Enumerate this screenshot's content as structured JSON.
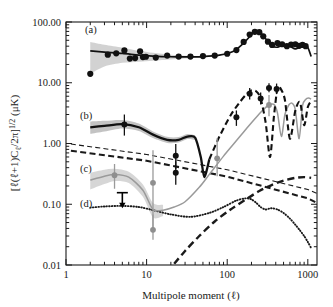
{
  "figure": {
    "name": "cmb-angular-power-spectra",
    "xlabel": "Multipole moment (ℓ)",
    "ylabel_main": "[ℓ(ℓ+1)C",
    "ylabel_sub": "ℓ",
    "ylabel_mid": "/2π]",
    "ylabel_sup": "1/2",
    "ylabel_units": "(μK)",
    "panel_labels": {
      "a": "(a)",
      "b": "(b)",
      "c": "(c)",
      "d": "(d)"
    },
    "x_ticks": [
      "1",
      "10",
      "100",
      "1000"
    ],
    "y_ticks": [
      "100.00",
      "10.00",
      "1.00",
      "0.10",
      "0.01"
    ]
  },
  "chart_data": {
    "type": "line",
    "title": "",
    "xlabel": "Multipole moment (ℓ)",
    "ylabel": "[ℓ(ℓ+1)Cℓ/2π]^1/2 (μK)",
    "xscale": "log",
    "yscale": "log",
    "xlim": [
      1,
      1300
    ],
    "ylim": [
      0.01,
      100.0
    ],
    "grid": false,
    "legend": "none",
    "panels": [
      {
        "key": "a",
        "label": "(a)",
        "description": "Temperature (TT) angular power spectrum",
        "style": "solid black curve with gray 1-sigma band at low multipoles, filled black circles"
      },
      {
        "key": "b",
        "label": "(b)",
        "description": "Temperature-polarization cross spectrum (TE), thick black solid and dashed curve with gray band",
        "style": "thick black solid / dashed"
      },
      {
        "key": "c",
        "label": "(c)",
        "description": "E-mode polarization (EE) spectrum, gray solid curve with gray points",
        "style": "gray solid"
      },
      {
        "key": "d",
        "label": "(d)",
        "description": "B-mode polarization from lensing (dotted) and gravitational waves (thick dashed rising)",
        "style": "dotted black / thick dashed"
      }
    ],
    "series": [
      {
        "name": "TT model curve",
        "panel": "a",
        "style": "solid-black",
        "x": [
          2,
          3,
          5,
          8,
          12,
          20,
          30,
          50,
          80,
          120,
          160,
          200,
          220,
          260,
          300,
          350,
          420,
          500,
          600,
          700,
          800,
          900,
          1000,
          1100
        ],
        "y": [
          33.5,
          32.0,
          30.5,
          28.5,
          27.5,
          26.8,
          26.6,
          27.0,
          28.5,
          33.0,
          45.0,
          62.0,
          70.0,
          66.0,
          53.0,
          41.0,
          38.5,
          43.0,
          40.0,
          36.0,
          39.0,
          40.5,
          38.0,
          27.0
        ]
      },
      {
        "name": "TT data points",
        "panel": "a",
        "style": "black-filled-circles",
        "x": [
          2,
          3.3,
          4.2,
          5.3,
          6.2,
          7.2,
          8.3,
          9.0,
          9.8,
          13,
          18,
          25,
          35,
          50,
          70,
          100,
          130,
          160,
          190,
          220,
          250,
          280,
          320,
          360,
          420,
          480,
          550,
          620,
          700,
          780,
          860,
          940
        ],
        "y": [
          14.0,
          29.0,
          30.5,
          34.0,
          25.0,
          25.5,
          33.0,
          26.5,
          26.8,
          26.0,
          28.0,
          27.0,
          27.0,
          27.5,
          28.0,
          30.0,
          34.5,
          47.0,
          62.0,
          69.0,
          68.0,
          58.0,
          47.5,
          42.0,
          45.0,
          43.0,
          40.0,
          42.5,
          43.0,
          40.5,
          42.0,
          40.0
        ]
      },
      {
        "name": "TE model curve",
        "panel": "b",
        "style": "thick-black-solid-then-dashed",
        "x": [
          2,
          3,
          5,
          8,
          12,
          18,
          25,
          32,
          40,
          47,
          52,
          60,
          80,
          110,
          140,
          170,
          200,
          230,
          260,
          300,
          340,
          380,
          420,
          460,
          520,
          600,
          700,
          800,
          900,
          1000,
          1100
        ],
        "y": [
          1.85,
          1.95,
          2.08,
          1.85,
          1.4,
          1.15,
          1.15,
          1.3,
          1.25,
          0.6,
          0.28,
          0.55,
          1.3,
          2.9,
          4.6,
          6.3,
          7.5,
          7.2,
          5.5,
          2.2,
          0.6,
          2.8,
          8.2,
          8.0,
          5.2,
          1.2,
          3.5,
          4.8,
          2.0,
          4.0,
          5.0
        ]
      },
      {
        "name": "TE data points",
        "panel": "b",
        "style": "black-filled-circles-with-errorbars",
        "x": [
          5.3,
          23,
          23,
          130,
          190,
          260,
          330,
          410
        ],
        "y": [
          2.05,
          0.63,
          0.33,
          2.7,
          6.6,
          5.5,
          8.2,
          7.9
        ],
        "yerr_lo": [
          0.7,
          0.25,
          0.12,
          0.75,
          1.3,
          1.1,
          1.2,
          1.4
        ],
        "yerr_hi": [
          0.95,
          0.35,
          0.18,
          0.8,
          1.6,
          1.4,
          1.6,
          1.8
        ]
      },
      {
        "name": "EE model curve",
        "panel": "c",
        "style": "gray-solid",
        "x": [
          2,
          3,
          4,
          6,
          9,
          12,
          16,
          22,
          30,
          45,
          60,
          90,
          120,
          160,
          200,
          240,
          280,
          330,
          380,
          420,
          470,
          520,
          580,
          640,
          700,
          780,
          860,
          940,
          1020,
          1100
        ],
        "y": [
          0.25,
          0.29,
          0.31,
          0.28,
          0.17,
          0.082,
          0.08,
          0.09,
          0.11,
          0.19,
          0.31,
          0.62,
          0.98,
          1.55,
          2.2,
          2.9,
          3.6,
          4.3,
          4.4,
          3.2,
          1.3,
          3.0,
          4.3,
          4.6,
          3.6,
          1.2,
          4.2,
          5.3,
          5.6,
          5.4
        ]
      },
      {
        "name": "EE data points",
        "panel": "c",
        "style": "gray-filled-circles-with-errorbars",
        "x": [
          4.0,
          12,
          12,
          75,
          330
        ],
        "y": [
          0.3,
          0.225,
          0.038,
          0.57,
          4.3
        ],
        "yerr_lo": [
          0.12,
          0.19,
          0.012,
          0.28,
          1.5
        ],
        "yerr_hi": [
          0.16,
          0.55,
          0.03,
          0.65,
          2.0
        ]
      },
      {
        "name": "BB lensing",
        "panel": "d",
        "style": "black-dotted",
        "x": [
          2,
          3,
          5,
          8,
          12,
          20,
          35,
          60,
          90,
          130,
          170,
          200,
          230,
          260,
          300,
          350,
          420,
          500,
          600,
          700,
          800,
          900,
          1000,
          1100
        ],
        "y": [
          0.088,
          0.092,
          0.094,
          0.09,
          0.08,
          0.068,
          0.062,
          0.072,
          0.09,
          0.115,
          0.125,
          0.12,
          0.105,
          0.09,
          0.082,
          0.086,
          0.082,
          0.072,
          0.058,
          0.046,
          0.037,
          0.03,
          0.024,
          0.019
        ]
      },
      {
        "name": "BB gravitational waves",
        "panel": "d",
        "style": "thick-black-dashed-rising",
        "x": [
          22,
          30,
          45,
          70,
          110,
          170,
          250,
          350,
          500,
          700,
          900,
          1100
        ],
        "y": [
          0.0105,
          0.017,
          0.03,
          0.052,
          0.082,
          0.12,
          0.165,
          0.205,
          0.245,
          0.272,
          0.28,
          0.272
        ]
      },
      {
        "name": "Foreground upper bound (thin dashed)",
        "panel": "foreground",
        "style": "thin-black-dashed-declining",
        "x": [
          1.15,
          10,
          100,
          1000,
          1300
        ],
        "y": [
          0.98,
          0.66,
          0.37,
          0.175,
          0.15
        ]
      },
      {
        "name": "Foreground lower bound (thick dashed)",
        "panel": "foreground",
        "style": "thick-black-dashed-declining",
        "x": [
          1.15,
          10,
          100,
          1000,
          1300
        ],
        "y": [
          0.76,
          0.52,
          0.285,
          0.125,
          0.105
        ]
      }
    ],
    "annotations": [
      {
        "type": "upper-limit-arrow",
        "x": 5.0,
        "y": 0.155,
        "direction": "down",
        "color": "#000000"
      }
    ]
  }
}
